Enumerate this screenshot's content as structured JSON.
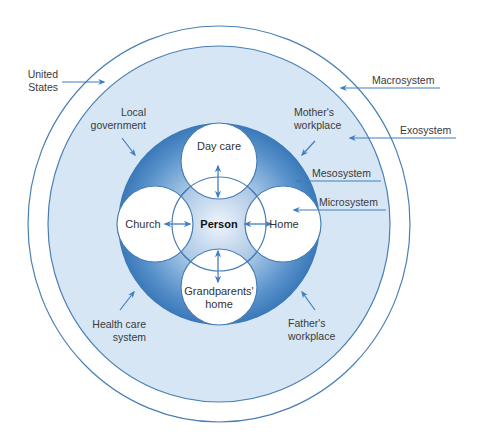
{
  "diagram": {
    "center": "Person",
    "microsystem_nodes": [
      "Day care",
      "Home",
      "Grandparents' home",
      "Church"
    ],
    "exosystem_labels": [
      "Local government",
      "Mother's workplace",
      "Health care system",
      "Father's workplace"
    ],
    "macrosystem_label": "United States",
    "system_levels": [
      "Macrosystem",
      "Exosystem",
      "Mesosystem",
      "Microsystem"
    ]
  },
  "labels": {
    "united_states": [
      "United",
      "States"
    ],
    "local_government": [
      "Local",
      "government"
    ],
    "mothers_workplace": [
      "Mother's",
      "workplace"
    ],
    "health_care": [
      "Health care",
      "system"
    ],
    "fathers_workplace": [
      "Father's",
      "workplace"
    ],
    "macrosystem": "Macrosystem",
    "exosystem": "Exosystem",
    "mesosystem": "Mesosystem",
    "microsystem": "Microsystem",
    "day_care": "Day care",
    "home": "Home",
    "church": "Church",
    "grandparents": [
      "Grandparents'",
      "home"
    ],
    "person": "Person"
  },
  "colors": {
    "ring_line": "#4a7fb5",
    "exo_fill": "#d6e6f5",
    "meso_dark": "#3f7fc0",
    "arrow": "#3f7fc0"
  }
}
